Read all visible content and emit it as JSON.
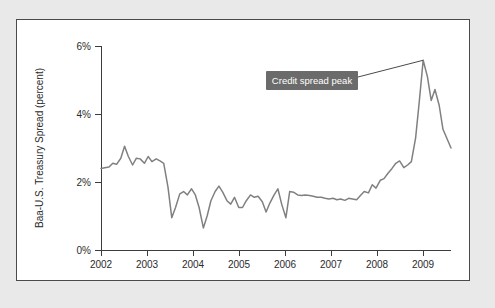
{
  "figure": {
    "background_color": "#e9e9e9",
    "panel_background": "#ffffff",
    "panel_border_color": "#4a4a4a"
  },
  "chart_data": {
    "type": "line",
    "title": "",
    "xlabel": "",
    "ylabel": "Baa-U.S. Treasury Spread (percent)",
    "xlim": [
      2002.0,
      2009.42
    ],
    "ylim": [
      0,
      6
    ],
    "grid": false,
    "legend": false,
    "line_color": "#808080",
    "x_tick_labels": [
      "2002",
      "2003",
      "2004",
      "2005",
      "2006",
      "2007",
      "2008",
      "2009"
    ],
    "x_ticks": [
      2002,
      2003,
      2004,
      2005,
      2006,
      2007,
      2008,
      2009
    ],
    "y_tick_labels": [
      "0%",
      "2%",
      "4%",
      "6%"
    ],
    "y_ticks": [
      0,
      2,
      4,
      6
    ],
    "series": [
      {
        "name": "Baa-U.S. Treasury Spread",
        "x": [
          2002.0,
          2002.08,
          2002.17,
          2002.25,
          2002.33,
          2002.42,
          2002.5,
          2002.58,
          2002.67,
          2002.75,
          2002.83,
          2002.92,
          2003.0,
          2003.08,
          2003.17,
          2003.25,
          2003.33,
          2003.42,
          2003.5,
          2003.58,
          2003.67,
          2003.75,
          2003.83,
          2003.92,
          2004.0,
          2004.08,
          2004.17,
          2004.25,
          2004.33,
          2004.42,
          2004.5,
          2004.58,
          2004.67,
          2004.75,
          2004.83,
          2004.92,
          2005.0,
          2005.08,
          2005.17,
          2005.25,
          2005.33,
          2005.42,
          2005.5,
          2005.58,
          2005.67,
          2005.75,
          2005.83,
          2005.92,
          2006.0,
          2006.08,
          2006.17,
          2006.25,
          2006.33,
          2006.42,
          2006.5,
          2006.58,
          2006.67,
          2006.75,
          2006.83,
          2006.92,
          2007.0,
          2007.08,
          2007.17,
          2007.25,
          2007.33,
          2007.42,
          2007.5,
          2007.58,
          2007.67,
          2007.75,
          2007.83,
          2007.92,
          2008.0,
          2008.08,
          2008.17,
          2008.25,
          2008.33,
          2008.42,
          2008.5,
          2008.58,
          2008.67,
          2008.75,
          2008.83,
          2008.92,
          2009.0,
          2009.08,
          2009.17,
          2009.25,
          2009.42
        ],
        "values": [
          2.4,
          2.42,
          2.44,
          2.55,
          2.52,
          2.7,
          3.05,
          2.75,
          2.5,
          2.7,
          2.68,
          2.55,
          2.75,
          2.6,
          2.68,
          2.62,
          2.55,
          1.85,
          0.95,
          1.25,
          1.65,
          1.72,
          1.62,
          1.8,
          1.62,
          1.25,
          0.65,
          1.0,
          1.45,
          1.72,
          1.88,
          1.7,
          1.45,
          1.35,
          1.55,
          1.25,
          1.25,
          1.45,
          1.62,
          1.55,
          1.58,
          1.42,
          1.12,
          1.38,
          1.62,
          1.8,
          1.35,
          0.95,
          1.72,
          1.7,
          1.62,
          1.6,
          1.62,
          1.6,
          1.58,
          1.55,
          1.55,
          1.52,
          1.5,
          1.52,
          1.48,
          1.5,
          1.46,
          1.52,
          1.5,
          1.48,
          1.6,
          1.72,
          1.68,
          1.92,
          1.82,
          2.05,
          2.1,
          2.25,
          2.4,
          2.55,
          2.62,
          2.42,
          2.5,
          2.6,
          3.3,
          4.4,
          5.58,
          5.1,
          4.4,
          4.72,
          4.25,
          3.55,
          3.0
        ]
      }
    ],
    "annotations": [
      {
        "text": "Credit spread peak",
        "box_color": "#6b6b6b",
        "text_color": "#ffffff",
        "points_to_x": 2008.83,
        "points_to_y": 5.58
      }
    ]
  }
}
